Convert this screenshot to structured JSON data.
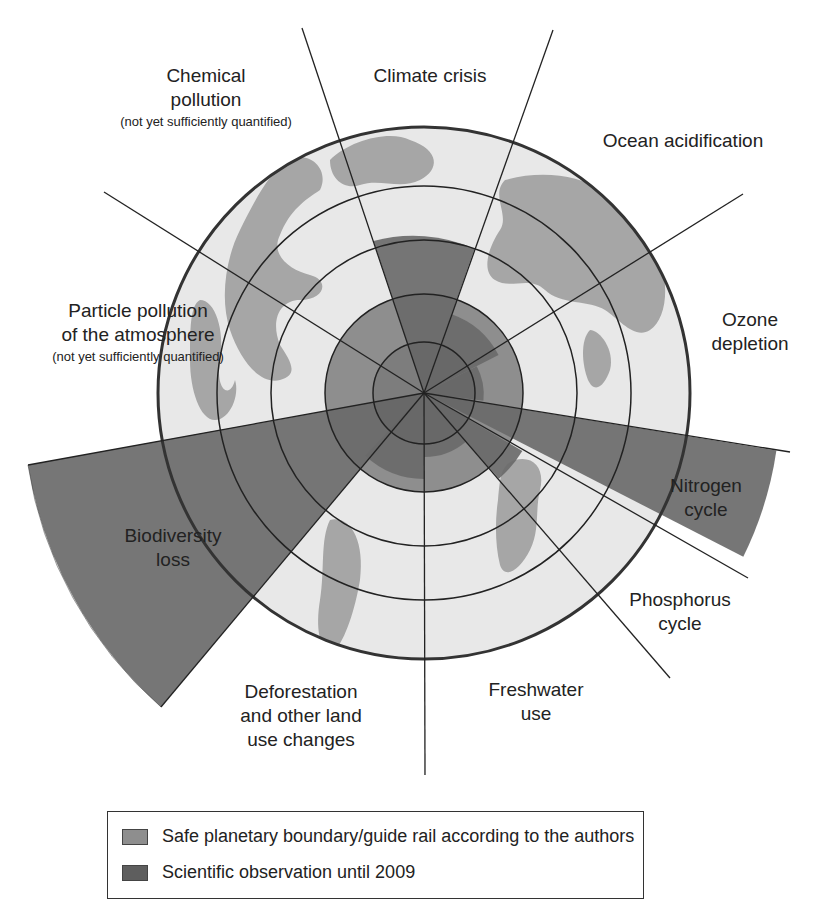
{
  "diagram": {
    "type": "planetary-boundaries-radial",
    "center": [
      424,
      393
    ],
    "ring_radii": [
      51,
      99,
      153,
      207
    ],
    "outer_radius": 266,
    "colors": {
      "background": "#ffffff",
      "globe_ocean": "#e8e8e8",
      "globe_land": "#a6a6a6",
      "safe_boundary": "#8e8e8e",
      "observation": "#6a6a6a",
      "lines": "#222222"
    },
    "safe_boundary_radius": 99
  },
  "sectors": [
    {
      "id": "climate-crisis",
      "label": "Climate crisis",
      "sub": "",
      "observed_radius": 153
    },
    {
      "id": "ocean-acidification",
      "label": "Ocean acidification",
      "sub": "",
      "observed_radius": 84
    },
    {
      "id": "ozone-depletion",
      "label": "Ozone depletion",
      "sub": "",
      "observed_radius": 60
    },
    {
      "id": "nitrogen-cycle",
      "label": "Nitrogen cycle",
      "sub": "",
      "observed_radius": 352
    },
    {
      "id": "phosphorus-cycle",
      "label": "Phosphorus cycle",
      "sub": "",
      "observed_radius": 112
    },
    {
      "id": "freshwater-use",
      "label": "Freshwater use",
      "sub": "",
      "observed_radius": 64
    },
    {
      "id": "land-use-change",
      "label": "Deforestation and other land use changes",
      "sub": "",
      "observed_radius": 86
    },
    {
      "id": "biodiversity-loss",
      "label": "Biodiversity loss",
      "sub": "",
      "observed_radius": 410
    },
    {
      "id": "particle-pollution",
      "label": "Particle pollution of the atmosphere",
      "sub": "(not yet sufficiently quantified)",
      "observed_radius": null
    },
    {
      "id": "chemical-pollution",
      "label": "Chemical pollution",
      "sub": "(not yet sufficiently quantified)",
      "observed_radius": null
    }
  ],
  "labels": {
    "chemical": {
      "line1": "Chemical",
      "line2": "pollution",
      "sub": "(not yet sufficiently quantified)"
    },
    "climate": {
      "line1": "Climate crisis"
    },
    "ocean": {
      "line1": "Ocean acidification"
    },
    "ozone": {
      "line1": "Ozone",
      "line2": "depletion"
    },
    "particle": {
      "line1": "Particle pollution",
      "line2": "of the atmosphere",
      "sub": "(not yet sufficiently quantified)"
    },
    "nitrogen": {
      "line1": "Nitrogen",
      "line2": "cycle"
    },
    "biodiversity": {
      "line1": "Biodiversity",
      "line2": "loss"
    },
    "phosphorus": {
      "line1": "Phosphorus",
      "line2": "cycle"
    },
    "freshwater": {
      "line1": "Freshwater",
      "line2": "use"
    },
    "deforestation": {
      "line1": "Deforestation",
      "line2": "and other land",
      "line3": "use changes"
    }
  },
  "legend": {
    "items": [
      {
        "label": "Safe planetary boundary/guide rail according to the authors",
        "color": "#8e8e8e"
      },
      {
        "label": "Scientific observation until 2009",
        "color": "#5e5e5e"
      }
    ]
  }
}
